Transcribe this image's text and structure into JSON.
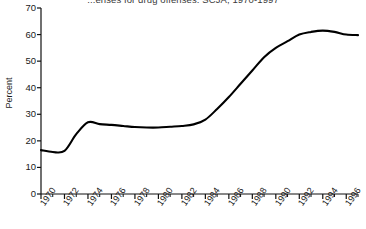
{
  "chart_data": {
    "type": "line",
    "title": "...enses for drug offenses: SCJA, 1970-1997",
    "xlabel": "",
    "ylabel": "Percent",
    "ylim": [
      0,
      70
    ],
    "xlim": [
      1970,
      1997
    ],
    "yticks": [
      0,
      10,
      20,
      30,
      40,
      50,
      60,
      70
    ],
    "xticks_major": [
      1970,
      1972,
      1974,
      1976,
      1978,
      1980,
      1982,
      1984,
      1986,
      1988,
      1990,
      1992,
      1994,
      1996
    ],
    "xticks_minor": [
      1971,
      1973,
      1975,
      1977,
      1979,
      1981,
      1983,
      1985,
      1987,
      1989,
      1991,
      1993,
      1995,
      1997
    ],
    "grid": false,
    "legend": false,
    "line_color": "#000000",
    "x": [
      1970,
      1971,
      1972,
      1973,
      1974,
      1975,
      1976,
      1977,
      1978,
      1979,
      1980,
      1981,
      1982,
      1983,
      1984,
      1985,
      1986,
      1987,
      1988,
      1989,
      1990,
      1991,
      1992,
      1993,
      1994,
      1995,
      1996,
      1997
    ],
    "values": [
      16.5,
      15.8,
      16.2,
      22.5,
      27.0,
      26.3,
      26.0,
      25.6,
      25.2,
      25.0,
      25.0,
      25.3,
      25.6,
      26.2,
      28.0,
      32.0,
      36.5,
      41.5,
      46.5,
      51.5,
      55.0,
      57.5,
      60.0,
      61.0,
      61.5,
      61.0,
      60.0,
      59.8
    ]
  },
  "axis": {
    "ytick_labels": [
      "70",
      "60",
      "50",
      "40",
      "30",
      "20",
      "10",
      "0"
    ],
    "xtick_labels": [
      "1970",
      "1972",
      "1974",
      "1976",
      "1978",
      "1980",
      "1982",
      "1984",
      "1986",
      "1988",
      "1990",
      "1992",
      "1994",
      "1996"
    ]
  }
}
